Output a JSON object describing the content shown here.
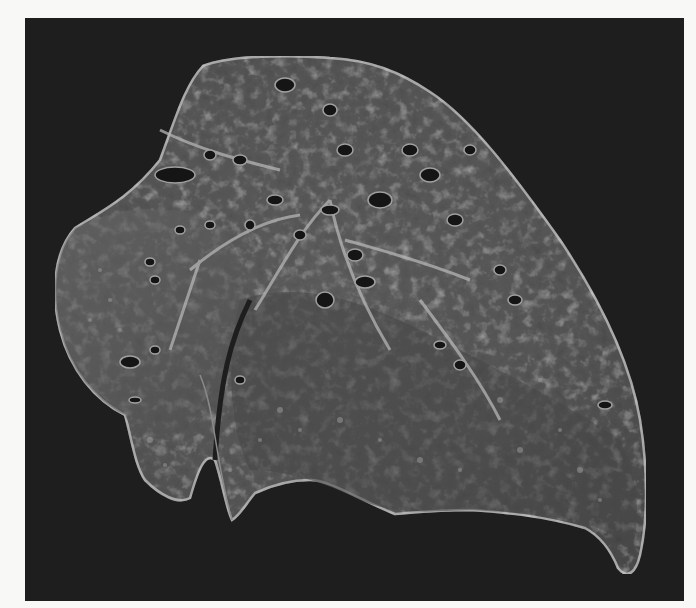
{
  "image": {
    "kind": "photograph",
    "subject": "gross pathology specimen — sectioned lung with multiple cavities",
    "palette": {
      "border": "#f8f8f6",
      "background": "#1e1e1e",
      "tissue_dark": "#3a3a3a",
      "tissue_mid": "#6e6e6e",
      "tissue_light": "#b8b8b8",
      "cavity": "#141414"
    }
  }
}
